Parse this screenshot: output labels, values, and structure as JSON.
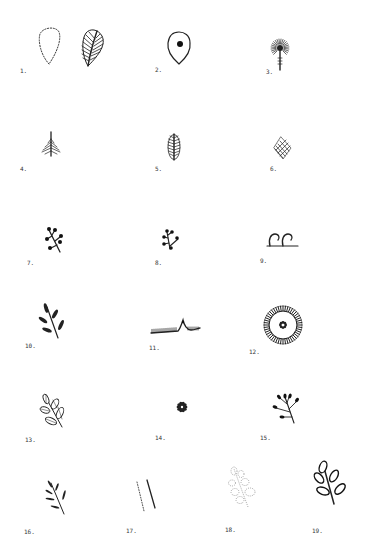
{
  "page": {
    "type": "illustration-plate",
    "ink_color": "#222222",
    "background_color": "#ffffff"
  },
  "figures": [
    {
      "number": 1,
      "label": "1.",
      "icon": "dotted-leaf-outline-and-hatched-leaf"
    },
    {
      "number": 2,
      "label": "2.",
      "icon": "teardrop-outline-with-dot"
    },
    {
      "number": 3,
      "label": "3.",
      "icon": "radiating-flower-on-stem"
    },
    {
      "number": 4,
      "label": "4.",
      "icon": "diamond-fishbone-leaf"
    },
    {
      "number": 5,
      "label": "5.",
      "icon": "oval-fishbone-leaf"
    },
    {
      "number": 6,
      "label": "6.",
      "icon": "diamond-hatched-leaf"
    },
    {
      "number": 7,
      "label": "7.",
      "icon": "sprig-with-berries"
    },
    {
      "number": 8,
      "label": "8.",
      "icon": "small-sprig-with-berries"
    },
    {
      "number": 9,
      "label": "9.",
      "icon": "curl-scrolls-on-line"
    },
    {
      "number": 10,
      "label": "10.",
      "icon": "sprig-with-solid-leaves"
    },
    {
      "number": 11,
      "label": "11.",
      "icon": "fringed-line-with-peak"
    },
    {
      "number": 12,
      "label": "12.",
      "icon": "ringed-circle-with-center-flower"
    },
    {
      "number": 13,
      "label": "13.",
      "icon": "sprig-with-outlined-leaves"
    },
    {
      "number": 14,
      "label": "14.",
      "icon": "small-rosette"
    },
    {
      "number": 15,
      "label": "15.",
      "icon": "sprig-with-buds"
    },
    {
      "number": 16,
      "label": "16.",
      "icon": "sprig-with-narrow-leaves"
    },
    {
      "number": 17,
      "label": "17.",
      "icon": "dotted-and-solid-diagonal-lines"
    },
    {
      "number": 18,
      "label": "18.",
      "icon": "dotted-sprig"
    },
    {
      "number": 19,
      "label": "19.",
      "icon": "sprig-with-loop-leaves"
    }
  ]
}
